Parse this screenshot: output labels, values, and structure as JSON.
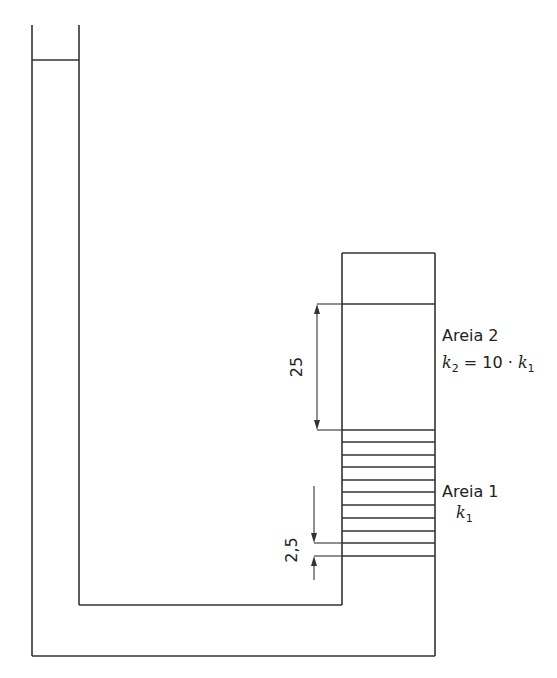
{
  "diagram": {
    "title": "",
    "colors": {
      "line": "#333333",
      "text": "#222222",
      "background": "#ffffff"
    },
    "sand_upper": {
      "name": "Areia 2",
      "k_symbol": "k",
      "k_sub": "2",
      "relation_mid": " = 10 · ",
      "relation_k": "k",
      "relation_sub": "1"
    },
    "sand_lower": {
      "name": "Areia 1",
      "k_symbol": "k",
      "k_sub": "1",
      "hatch_lines_y": [
        430,
        442,
        455,
        467,
        480,
        492,
        505,
        518,
        531,
        543,
        556
      ]
    },
    "dimensions": {
      "upper_length": "25",
      "head_difference": "2,5"
    }
  }
}
